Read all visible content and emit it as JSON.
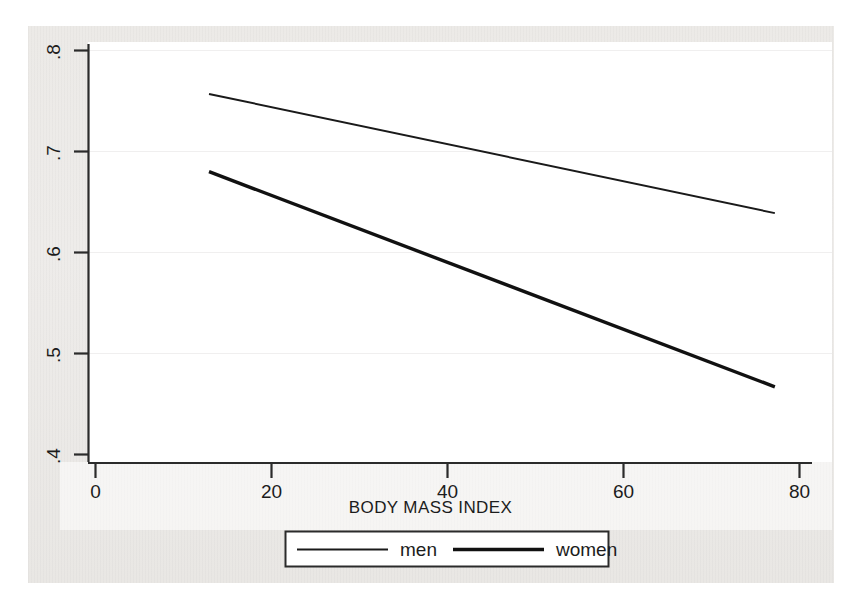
{
  "chart_data": {
    "type": "line",
    "title": "",
    "subtitle": "",
    "xlabel": "BODY MASS INDEX",
    "ylabel": "",
    "xlim": [
      0,
      80
    ],
    "ylim": [
      0.4,
      0.8
    ],
    "xticks": [
      "0",
      "20",
      "40",
      "60",
      "80"
    ],
    "xtick_values": [
      0,
      20,
      40,
      60,
      80
    ],
    "yticks": [
      ".4",
      ".5",
      ".6",
      ".7",
      ".8"
    ],
    "ytick_values": [
      0.4,
      0.5,
      0.6,
      0.7,
      0.8
    ],
    "grid": "horizontal-faint",
    "legend_position": "bottom-center",
    "series": [
      {
        "name": "men",
        "line_style": "thin",
        "line_width_px": 2,
        "color": "#1a1a1a",
        "x": [
          12.9,
          77.2
        ],
        "values": [
          0.757,
          0.639
        ]
      },
      {
        "name": "women",
        "line_style": "thick",
        "line_width_px": 3.4,
        "color": "#111111",
        "x": [
          12.9,
          77.2
        ],
        "values": [
          0.68,
          0.467
        ]
      }
    ],
    "annotations": []
  },
  "axes": {
    "x_axis_title": "BODY MASS INDEX",
    "x_tick_labels": [
      "0",
      "20",
      "40",
      "60",
      "80"
    ],
    "y_tick_labels": [
      ".8",
      ".7",
      ".6",
      ".5",
      ".4"
    ]
  },
  "legend": {
    "entries": [
      {
        "label": "men",
        "swatch": "thin-line-swatch"
      },
      {
        "label": "women",
        "swatch": "thick-line-swatch"
      }
    ]
  },
  "colors": {
    "ink": "#1a1a1a",
    "axis": "#2b2b2b",
    "gridline": "#efefef",
    "paper": "#eceae7",
    "plot_background": "#ffffff"
  }
}
